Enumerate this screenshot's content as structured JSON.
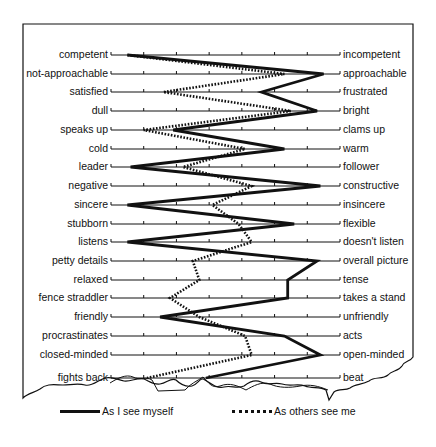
{
  "chart_data": {
    "type": "line",
    "title": "",
    "orientation": "horizontal semantic-differential profile",
    "scale_points": 8,
    "xlim": [
      0,
      7
    ],
    "grid": false,
    "legend_position": "bottom",
    "left_labels": [
      "competent",
      "not-approachable",
      "satisfied",
      "dull",
      "speaks up",
      "cold",
      "leader",
      "negative",
      "sincere",
      "stubborn",
      "listens",
      "petty details",
      "relaxed",
      "fence straddler",
      "friendly",
      "procrastinates",
      "closed-minded",
      "fights back"
    ],
    "right_labels": [
      "incompetent",
      "approachable",
      "frustrated",
      "bright",
      "clams up",
      "warm",
      "follower",
      "constructive",
      "insincere",
      "flexible",
      "doesn't listen",
      "overall picture",
      "tense",
      "takes a stand",
      "unfriendly",
      "acts",
      "open-minded",
      "beat"
    ],
    "series": [
      {
        "name": "As I see myself",
        "style": "solid",
        "values": [
          0.5,
          6.5,
          4.6,
          6.3,
          1.9,
          5.3,
          0.6,
          6.4,
          0.5,
          5.6,
          0.5,
          6.3,
          5.4,
          5.4,
          1.5,
          5.3,
          6.4,
          2.9
        ]
      },
      {
        "name": "As others see me",
        "style": "dotted",
        "values": [
          0.5,
          5.3,
          1.6,
          5.5,
          1.0,
          4.1,
          2.2,
          4.3,
          3.1,
          3.9,
          4.3,
          2.5,
          2.7,
          1.8,
          2.7,
          4.1,
          4.3,
          1.1
        ]
      }
    ]
  },
  "layout": {
    "axis_x_start": 111,
    "axis_x_end": 340,
    "row_y": [
      55,
      74,
      92,
      111,
      130,
      149,
      167,
      186,
      205,
      224,
      242,
      261,
      280,
      298,
      317,
      336,
      355,
      378
    ]
  },
  "legend": {
    "self_label": "As I see myself",
    "others_label": "As others see me"
  },
  "colors": {
    "ink": "#111111",
    "paper": "#ffffff"
  }
}
